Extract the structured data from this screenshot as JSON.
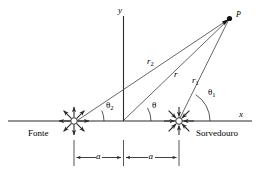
{
  "figure": {
    "type": "physics-diagram",
    "axes": {
      "x_label": "x",
      "y_label": "y",
      "origin_label": ""
    },
    "points": [
      {
        "id": "P",
        "label": "P",
        "role": "field-point"
      }
    ],
    "elements": [
      {
        "id": "source",
        "label": "Fonte",
        "role": "source",
        "arrows": "outward"
      },
      {
        "id": "sink",
        "label": "Sorvedouro",
        "role": "sink",
        "arrows": "inward"
      }
    ],
    "vectors": [
      {
        "id": "r2",
        "base": "r",
        "sub": "2",
        "from": "source",
        "to": "P"
      },
      {
        "id": "r",
        "base": "r",
        "sub": "",
        "from": "origin",
        "to": "P"
      },
      {
        "id": "r1",
        "base": "r",
        "sub": "1",
        "from": "sink",
        "to": "P"
      }
    ],
    "angles": [
      {
        "id": "theta2",
        "base": "θ",
        "sub": "2",
        "at": "source"
      },
      {
        "id": "theta",
        "base": "θ",
        "sub": "",
        "at": "origin"
      },
      {
        "id": "theta1",
        "base": "θ",
        "sub": "1",
        "at": "sink"
      }
    ],
    "dimensions": [
      {
        "id": "a-left",
        "label": "a",
        "from": "source",
        "to": "origin"
      },
      {
        "id": "a-right",
        "label": "a",
        "from": "origin",
        "to": "sink"
      }
    ],
    "colors": {
      "stroke": "#2b2b2b",
      "text": "#000000",
      "background": "#ffffff"
    }
  }
}
